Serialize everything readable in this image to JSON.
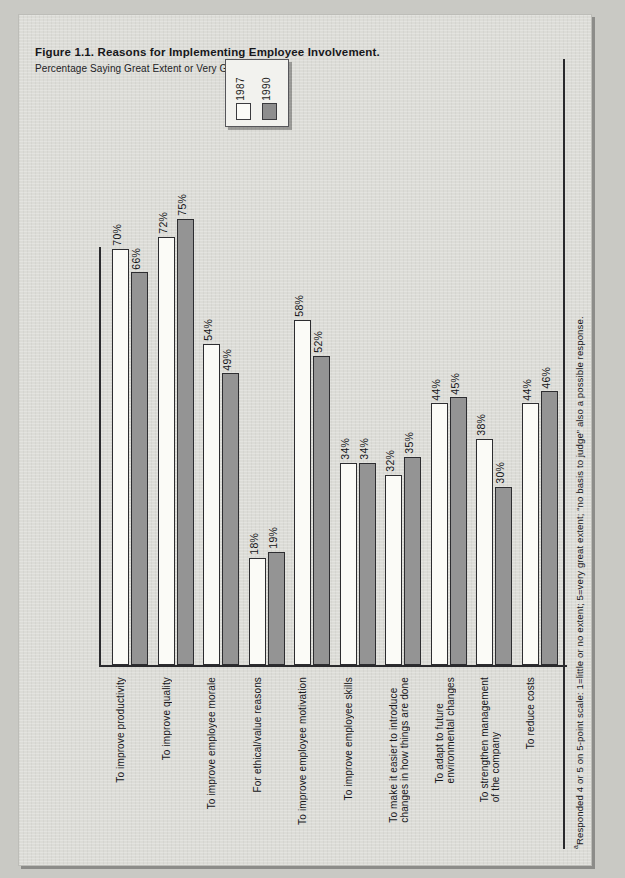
{
  "figure": {
    "title": "Figure 1.1. Reasons for Implementing Employee Involvement.",
    "subtitle_text": "Percentage Saying Great Extent or Very Great Extent",
    "subtitle_marker": "a",
    "footnote_marker": "a",
    "footnote_text": "Responded 4 or 5 on 5-point scale: 1=little or no extent; 5=very great extent; “no basis to judge” also a possible response."
  },
  "legend": {
    "entries": [
      {
        "label": "1987",
        "color": "#fbfbf7"
      },
      {
        "label": "1990",
        "color": "#949494"
      }
    ]
  },
  "colors": {
    "page_background": "#c9c9c4",
    "panel_background": "#dcdcd7",
    "axis": "#2a2a2d",
    "series_1987": "#fbfbf7",
    "series_1990": "#949494",
    "text": "#16161a"
  },
  "chart_data": {
    "type": "bar",
    "title": "Figure 1.1. Reasons for Implementing Employee Involvement.",
    "subtitle": "Percentage Saying Great Extent or Very Great Extent",
    "xlabel": "",
    "ylabel": "",
    "ylim": [
      0,
      80
    ],
    "grid": false,
    "legend_position": "top-center",
    "value_suffix": "%",
    "categories": [
      "To improve productivity",
      "To improve quality",
      "To improve employee morale",
      "For ethical/value reasons",
      "To improve employee motivation",
      "To improve employee skills",
      "To make it easier to introduce\nchanges in how things are done",
      "To adapt to future\nenvironmental changes",
      "To strengthen management\nof the company",
      "To reduce costs"
    ],
    "series": [
      {
        "name": "1987",
        "values": [
          70,
          72,
          54,
          18,
          58,
          34,
          32,
          44,
          38,
          44
        ]
      },
      {
        "name": "1990",
        "values": [
          66,
          75,
          49,
          19,
          52,
          34,
          35,
          45,
          30,
          46
        ]
      }
    ],
    "data_labels": {
      "1987": [
        "70%",
        "72%",
        "54%",
        "18%",
        "58%",
        "34%",
        "32%",
        "44%",
        "38%",
        "44%"
      ],
      "1990": [
        "66%",
        "75%",
        "49%",
        "19%",
        "52%",
        "34%",
        "35%",
        "45%",
        "30%",
        "46%"
      ]
    }
  }
}
